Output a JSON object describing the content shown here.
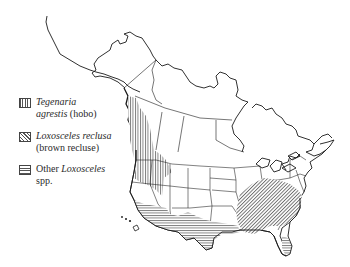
{
  "figure": {
    "type": "range-map",
    "region": "North America"
  },
  "legend": {
    "items": [
      {
        "pattern": "vertical-hatch",
        "name_italic": "Tegenaria",
        "line2_italic": "agrestis",
        "line2_plain": " (hobo)"
      },
      {
        "pattern": "diagonal-hatch",
        "name_italic": "Loxosceles reclusa",
        "line2_italic": "",
        "line2_plain": "(brown recluse)"
      },
      {
        "pattern": "horizontal-hatch",
        "name_plain": "Other ",
        "name_italic": "Loxosceles",
        "line2_italic": "",
        "line2_plain": "spp."
      }
    ]
  },
  "colors": {
    "outline": "#1a1a1a",
    "hatch": "#555555",
    "background": "#ffffff"
  }
}
